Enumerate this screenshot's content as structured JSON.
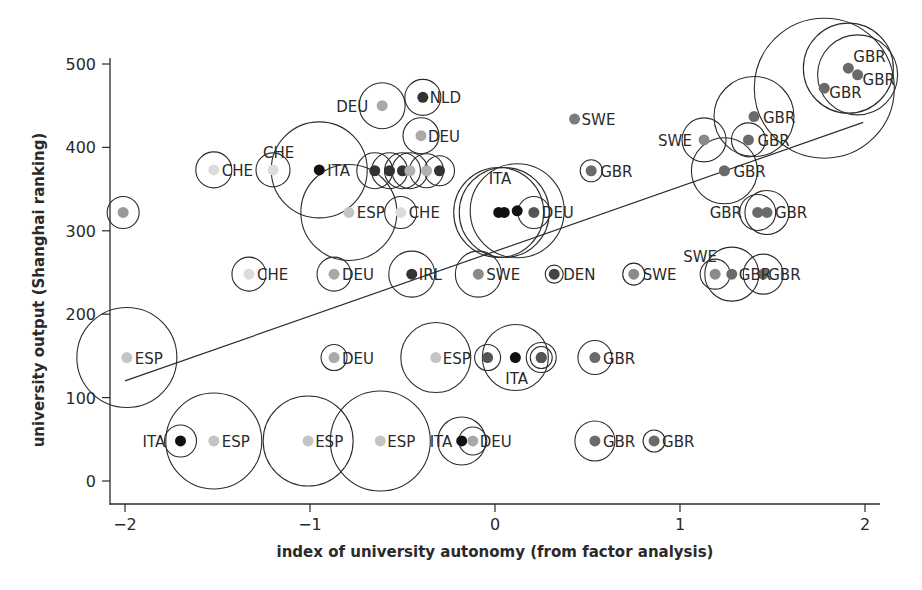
{
  "chart_data": {
    "type": "scatter",
    "title": "",
    "xlabel": "index of university autonomy (from factor analysis)",
    "ylabel": "university output (Shanghai ranking)",
    "xlim": [
      -2.1,
      2.05
    ],
    "ylim": [
      -20,
      520
    ],
    "xticks": [
      -2,
      -1,
      0,
      1,
      2
    ],
    "xtick_labels": [
      "−2",
      "−1",
      "0",
      "1",
      "2"
    ],
    "yticks": [
      0,
      100,
      200,
      300,
      400,
      500
    ],
    "ytick_labels": [
      "0",
      "100",
      "200",
      "300",
      "400",
      "500"
    ],
    "grid": false,
    "legend": null,
    "bubble_encoding": "circle radius proportional to a third variable (unlabeled); dot shade distinguishes countries",
    "trend_line": {
      "x": [
        -2.0,
        1.99
      ],
      "y": [
        120,
        430
      ]
    },
    "points": [
      {
        "label": "",
        "x": -2.01,
        "y": 322,
        "r": 16,
        "shade": "#9a9a9a",
        "lx": 0,
        "ly": 0
      },
      {
        "label": "CHE",
        "x": -1.52,
        "y": 373,
        "r": 18,
        "shade": "#dcdcdc",
        "lx": 8,
        "ly": 6
      },
      {
        "label": "CHE",
        "x": -1.2,
        "y": 373,
        "r": 17,
        "shade": "#dcdcdc",
        "lx": -10,
        "ly": -12
      },
      {
        "label": "ITA",
        "x": -0.95,
        "y": 373,
        "r": 48,
        "shade": "#111111",
        "lx": 8,
        "ly": 6
      },
      {
        "label": "ESP",
        "x": -0.79,
        "y": 322,
        "r": 48,
        "shade": "#c4c4c4",
        "lx": 8,
        "ly": 6
      },
      {
        "label": "DEU",
        "x": -0.61,
        "y": 450,
        "r": 23,
        "shade": "#a9a9a9",
        "lx": -46,
        "ly": 6
      },
      {
        "label": "NLD",
        "x": -0.39,
        "y": 460,
        "r": 18,
        "shade": "#333333",
        "lx": 7,
        "ly": 6
      },
      {
        "label": "DEU",
        "x": -0.4,
        "y": 414,
        "r": 18,
        "shade": "#a9a9a9",
        "lx": 7,
        "ly": 6
      },
      {
        "label": "",
        "x": -0.65,
        "y": 372,
        "r": 18,
        "shade": "#333333",
        "lx": 0,
        "ly": 0
      },
      {
        "label": "",
        "x": -0.57,
        "y": 372,
        "r": 18,
        "shade": "#333333",
        "lx": 0,
        "ly": 0
      },
      {
        "label": "",
        "x": -0.5,
        "y": 372,
        "r": 18,
        "shade": "#333333",
        "lx": 0,
        "ly": 0
      },
      {
        "label": "",
        "x": -0.46,
        "y": 372,
        "r": 18,
        "shade": "#b0b0b0",
        "lx": 0,
        "ly": 0
      },
      {
        "label": "",
        "x": -0.37,
        "y": 372,
        "r": 17,
        "shade": "#b0b0b0",
        "lx": 0,
        "ly": 0
      },
      {
        "label": "",
        "x": -0.3,
        "y": 372,
        "r": 15,
        "shade": "#333333",
        "lx": 0,
        "ly": 0
      },
      {
        "label": "CHE",
        "x": -0.51,
        "y": 322,
        "r": 16,
        "shade": "#dcdcdc",
        "lx": 8,
        "ly": 6
      },
      {
        "label": "ITA",
        "x": 0.02,
        "y": 322,
        "r": 45,
        "shade": "#111111",
        "lx": -10,
        "ly": -28
      },
      {
        "label": "",
        "x": 0.05,
        "y": 322,
        "r": 45,
        "shade": "#111111",
        "lx": 0,
        "ly": 0
      },
      {
        "label": "",
        "x": 0.12,
        "y": 324,
        "r": 47,
        "shade": "#111111",
        "lx": 0,
        "ly": 0
      },
      {
        "label": "DEU",
        "x": 0.21,
        "y": 322,
        "r": 16,
        "shade": "#555555",
        "lx": 8,
        "ly": 6
      },
      {
        "label": "SWE",
        "x": 0.43,
        "y": 434,
        "r": 0,
        "shade": "#7d7d7d",
        "lx": 7,
        "ly": 6
      },
      {
        "label": "GBR",
        "x": 0.52,
        "y": 372,
        "r": 11,
        "shade": "#6a6a6a",
        "lx": 9,
        "ly": 6
      },
      {
        "label": "SWE",
        "x": 1.13,
        "y": 409,
        "r": 22,
        "shade": "#8a8a8a",
        "lx": -46,
        "ly": 6
      },
      {
        "label": "GBR",
        "x": 1.4,
        "y": 437,
        "r": 40,
        "shade": "#6a6a6a",
        "lx": 9,
        "ly": 6
      },
      {
        "label": "GBR",
        "x": 1.37,
        "y": 409,
        "r": 17,
        "shade": "#6a6a6a",
        "lx": 9,
        "ly": 6
      },
      {
        "label": "GBR",
        "x": 1.24,
        "y": 372,
        "r": 33,
        "shade": "#6a6a6a",
        "lx": 9,
        "ly": 6
      },
      {
        "label": "GBR",
        "x": 1.42,
        "y": 322,
        "r": 18,
        "shade": "#6a6a6a",
        "lx": -48,
        "ly": 6
      },
      {
        "label": "GBR",
        "x": 1.47,
        "y": 322,
        "r": 22,
        "shade": "#6a6a6a",
        "lx": 8,
        "ly": 6
      },
      {
        "label": "GBR",
        "x": 1.91,
        "y": 495,
        "r": 45,
        "shade": "#6a6a6a",
        "lx": 5,
        "ly": -6
      },
      {
        "label": "GBR",
        "x": 1.96,
        "y": 487,
        "r": 40,
        "shade": "#6a6a6a",
        "lx": 5,
        "ly": 10
      },
      {
        "label": "GBR",
        "x": 1.78,
        "y": 471,
        "r": 70,
        "shade": "#6a6a6a",
        "lx": 5,
        "ly": 10
      },
      {
        "label": "CHE",
        "x": -1.33,
        "y": 248,
        "r": 17,
        "shade": "#dcdcdc",
        "lx": 8,
        "ly": 6
      },
      {
        "label": "DEU",
        "x": -0.87,
        "y": 248,
        "r": 17,
        "shade": "#a9a9a9",
        "lx": 8,
        "ly": 6
      },
      {
        "label": "IRL",
        "x": -0.45,
        "y": 248,
        "r": 23,
        "shade": "#333333",
        "lx": 7,
        "ly": 6
      },
      {
        "label": "SWE",
        "x": -0.09,
        "y": 248,
        "r": 23,
        "shade": "#8a8a8a",
        "lx": 8,
        "ly": 6
      },
      {
        "label": "DEN",
        "x": 0.32,
        "y": 248,
        "r": 9,
        "shade": "#444444",
        "lx": 9,
        "ly": 6
      },
      {
        "label": "SWE",
        "x": 0.75,
        "y": 248,
        "r": 11,
        "shade": "#8a8a8a",
        "lx": 9,
        "ly": 6
      },
      {
        "label": "SWE",
        "x": 1.19,
        "y": 248,
        "r": 15,
        "shade": "#8a8a8a",
        "lx": -32,
        "ly": -12
      },
      {
        "label": "GBR",
        "x": 1.28,
        "y": 248,
        "r": 27,
        "shade": "#6a6a6a",
        "lx": 7,
        "ly": 6
      },
      {
        "label": "GBR",
        "x": 1.45,
        "y": 248,
        "r": 20,
        "shade": "#6a6a6a",
        "lx": 5,
        "ly": 6
      },
      {
        "label": "ESP",
        "x": -1.99,
        "y": 148,
        "r": 50,
        "shade": "#c4c4c4",
        "lx": 8,
        "ly": 6
      },
      {
        "label": "DEU",
        "x": -0.87,
        "y": 148,
        "r": 13,
        "shade": "#a9a9a9",
        "lx": 8,
        "ly": 6
      },
      {
        "label": "ESP",
        "x": -0.32,
        "y": 148,
        "r": 35,
        "shade": "#c4c4c4",
        "lx": 7,
        "ly": 6
      },
      {
        "label": "",
        "x": -0.04,
        "y": 148,
        "r": 13,
        "shade": "#555555",
        "lx": 0,
        "ly": 0
      },
      {
        "label": "ITA",
        "x": 0.11,
        "y": 148,
        "r": 33,
        "shade": "#111111",
        "lx": -10,
        "ly": 26
      },
      {
        "label": "",
        "x": 0.25,
        "y": 148,
        "r": 15,
        "shade": "#555555",
        "lx": 0,
        "ly": 0
      },
      {
        "label": "",
        "x": 0.25,
        "y": 148,
        "r": 11,
        "shade": "#555555",
        "lx": 0,
        "ly": 0
      },
      {
        "label": "GBR",
        "x": 0.54,
        "y": 148,
        "r": 17,
        "shade": "#6a6a6a",
        "lx": 8,
        "ly": 6
      },
      {
        "label": "ITA",
        "x": -1.7,
        "y": 48,
        "r": 16,
        "shade": "#111111",
        "lx": -38,
        "ly": 6
      },
      {
        "label": "ESP",
        "x": -1.52,
        "y": 48,
        "r": 48,
        "shade": "#c4c4c4",
        "lx": 8,
        "ly": 6
      },
      {
        "label": "ESP",
        "x": -1.01,
        "y": 48,
        "r": 45,
        "shade": "#c4c4c4",
        "lx": 7,
        "ly": 6
      },
      {
        "label": "ESP",
        "x": -0.62,
        "y": 48,
        "r": 50,
        "shade": "#c4c4c4",
        "lx": 7,
        "ly": 6
      },
      {
        "label": "ITA",
        "x": -0.18,
        "y": 48,
        "r": 24,
        "shade": "#111111",
        "lx": -32,
        "ly": 6
      },
      {
        "label": "DEU",
        "x": -0.12,
        "y": 48,
        "r": 14,
        "shade": "#a9a9a9",
        "lx": 7,
        "ly": 6
      },
      {
        "label": "GBR",
        "x": 0.54,
        "y": 48,
        "r": 20,
        "shade": "#6a6a6a",
        "lx": 8,
        "ly": 6
      },
      {
        "label": "GBR",
        "x": 0.86,
        "y": 48,
        "r": 11,
        "shade": "#6a6a6a",
        "lx": 8,
        "ly": 6
      }
    ]
  },
  "layout": {
    "x0_px": 495,
    "px_per_x": 185,
    "y0_px": 481,
    "px_per_y": 0.834
  }
}
